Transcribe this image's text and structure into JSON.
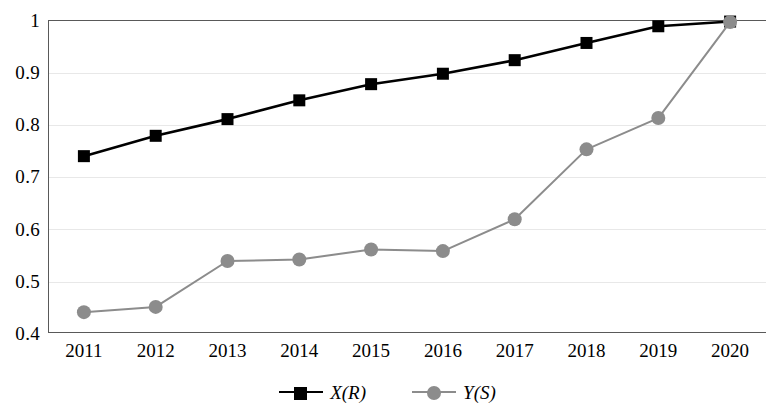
{
  "chart_data": {
    "type": "line",
    "title": "",
    "xlabel": "",
    "ylabel": "",
    "categories": [
      "2011",
      "2012",
      "2013",
      "2014",
      "2015",
      "2016",
      "2017",
      "2018",
      "2019",
      "2020"
    ],
    "x": [
      2011,
      2012,
      2013,
      2014,
      2015,
      2016,
      2017,
      2018,
      2019,
      2020
    ],
    "series": [
      {
        "name": "X(R)",
        "marker": "square",
        "color": "#000000",
        "values": [
          0.739,
          0.778,
          0.81,
          0.846,
          0.877,
          0.897,
          0.923,
          0.956,
          0.988,
          0.997
        ]
      },
      {
        "name": "Y(S)",
        "marker": "circle",
        "color": "#808080",
        "values": [
          0.44,
          0.45,
          0.538,
          0.541,
          0.56,
          0.557,
          0.618,
          0.752,
          0.812,
          0.996
        ]
      }
    ],
    "ylim": [
      0.4,
      1.0
    ],
    "yticks": [
      "0.4",
      "0.5",
      "0.6",
      "0.7",
      "0.8",
      "0.9",
      "1"
    ],
    "ytick_values": [
      0.4,
      0.5,
      0.6,
      0.7,
      0.8,
      0.9,
      1.0
    ],
    "grid": true,
    "grid_axis": "y",
    "legend_position": "bottom"
  },
  "legend": {
    "items": [
      {
        "label": "X(R)",
        "marker": "square-marker",
        "color": "#000000"
      },
      {
        "label": "Y(S)",
        "marker": "circle-marker",
        "color": "#808080"
      }
    ]
  },
  "axes": {
    "y_tick_labels": [
      "1",
      "0.9",
      "0.8",
      "0.7",
      "0.6",
      "0.5",
      "0.4"
    ],
    "x_tick_labels": [
      "2011",
      "2012",
      "2013",
      "2014",
      "2015",
      "2016",
      "2017",
      "2018",
      "2019",
      "2020"
    ]
  }
}
